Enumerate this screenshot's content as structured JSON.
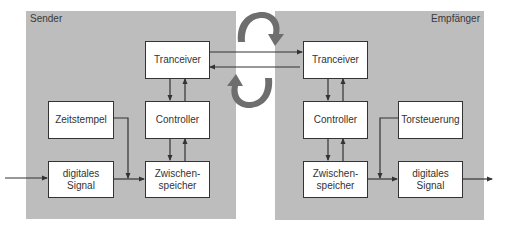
{
  "diagram": {
    "sender": {
      "label": "Sender",
      "blocks": {
        "tranceiver": "Tranceiver",
        "controller": "Controller",
        "zeitstempel": "Zeitstempel",
        "digitales_signal": [
          "digitales",
          "Signal"
        ],
        "zwischenspeicher": [
          "Zwischen-",
          "speicher"
        ]
      }
    },
    "receiver": {
      "label": "Empfänger",
      "blocks": {
        "tranceiver": "Tranceiver",
        "controller": "Controller",
        "torsteuerung": "Torsteuerung",
        "zwischenspeicher": [
          "Zwischen-",
          "speicher"
        ],
        "digitales_signal": [
          "digitales",
          "Signal"
        ]
      }
    },
    "colors": {
      "panel": "#bdbdbd",
      "box_border": "#333333",
      "line": "#333333",
      "exchange_arrow": "#6e6e6e"
    }
  }
}
